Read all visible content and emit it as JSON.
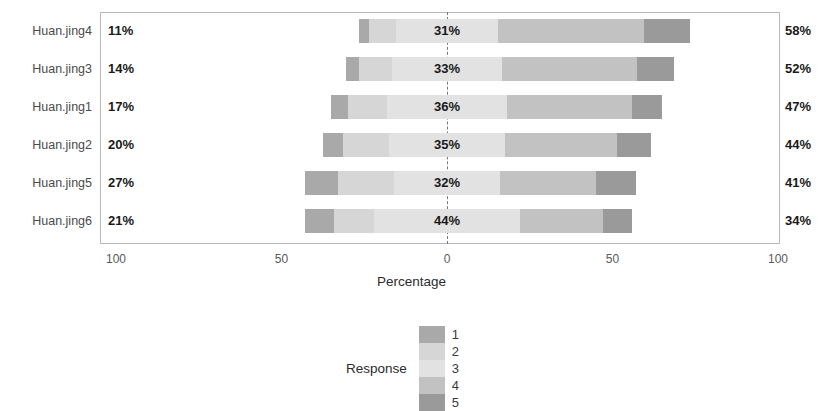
{
  "chart_data": {
    "type": "bar",
    "subtype": "diverging-stacked-likert",
    "title": "",
    "xlabel": "Percentage",
    "ylabel": "",
    "xlim": [
      -100,
      100
    ],
    "grid": false,
    "legend_position": "bottom",
    "legend_title": "Response",
    "categories": [
      "Huan.jing4",
      "Huan.jing3",
      "Huan.jing1",
      "Huan.jing2",
      "Huan.jing5",
      "Huan.jing6"
    ],
    "response_levels": [
      "1",
      "2",
      "3",
      "4",
      "5"
    ],
    "colors": {
      "1": "#a9a9a9",
      "2": "#d6d6d6",
      "3": "#e2e2e2",
      "4": "#c2c2c2",
      "5": "#9a9a9a"
    },
    "axis_ticks": [
      {
        "label": "100",
        "value": -100
      },
      {
        "label": "50",
        "value": -50
      },
      {
        "label": "0",
        "value": 0
      },
      {
        "label": "50",
        "value": 50
      },
      {
        "label": "100",
        "value": 100
      }
    ],
    "rows": [
      {
        "category": "Huan.jing4",
        "left_label": "11%",
        "mid_label": "31%",
        "right_label": "58%",
        "values": {
          "1": 3,
          "2": 8,
          "3": 31,
          "4": 44,
          "5": 14
        },
        "neutral": 31,
        "negative_total": 11,
        "positive_total": 58
      },
      {
        "category": "Huan.jing3",
        "left_label": "14%",
        "mid_label": "33%",
        "right_label": "52%",
        "values": {
          "1": 4,
          "2": 10,
          "3": 33,
          "4": 41,
          "5": 11
        },
        "neutral": 33,
        "negative_total": 14,
        "positive_total": 52
      },
      {
        "category": "Huan.jing1",
        "left_label": "17%",
        "mid_label": "36%",
        "right_label": "47%",
        "values": {
          "1": 5,
          "2": 12,
          "3": 36,
          "4": 38,
          "5": 9
        },
        "neutral": 36,
        "negative_total": 17,
        "positive_total": 47
      },
      {
        "category": "Huan.jing2",
        "left_label": "20%",
        "mid_label": "35%",
        "right_label": "44%",
        "values": {
          "1": 6,
          "2": 14,
          "3": 35,
          "4": 34,
          "5": 10
        },
        "neutral": 35,
        "negative_total": 20,
        "positive_total": 44
      },
      {
        "category": "Huan.jing5",
        "left_label": "27%",
        "mid_label": "32%",
        "right_label": "41%",
        "values": {
          "1": 10,
          "2": 17,
          "3": 32,
          "4": 29,
          "5": 12
        },
        "neutral": 32,
        "negative_total": 27,
        "positive_total": 41
      },
      {
        "category": "Huan.jing6",
        "left_label": "21%",
        "mid_label": "44%",
        "right_label": "34%",
        "values": {
          "1": 9,
          "2": 12,
          "3": 44,
          "4": 25,
          "5": 9
        },
        "neutral": 44,
        "negative_total": 21,
        "positive_total": 34
      }
    ]
  },
  "axis": {
    "title": "Percentage"
  },
  "legend": {
    "title": "Response",
    "items": [
      {
        "key": "1",
        "color": "#a9a9a9"
      },
      {
        "key": "2",
        "color": "#d6d6d6"
      },
      {
        "key": "3",
        "color": "#e2e2e2"
      },
      {
        "key": "4",
        "color": "#c2c2c2"
      },
      {
        "key": "5",
        "color": "#9a9a9a"
      }
    ]
  }
}
